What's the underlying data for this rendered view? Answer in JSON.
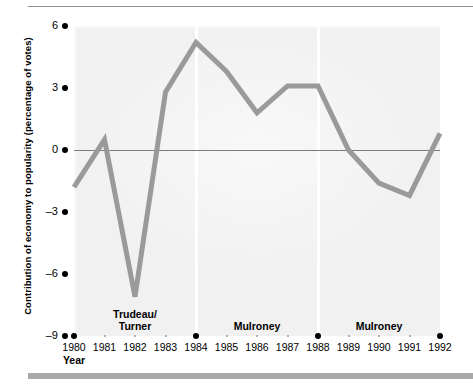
{
  "chart_data": {
    "type": "line",
    "title": "",
    "xlabel": "Year",
    "ylabel": "Contribution of economy to popularity (percentage of votes)",
    "x": [
      1980,
      1981,
      1982,
      1983,
      1984,
      1985,
      1986,
      1987,
      1988,
      1989,
      1990,
      1991,
      1992
    ],
    "values": [
      -1.8,
      0.5,
      -7.1,
      2.8,
      5.2,
      3.8,
      1.8,
      3.1,
      3.1,
      0.0,
      -1.6,
      -2.2,
      0.8
    ],
    "series": [
      {
        "name": "Contribution of economy to popularity",
        "values": [
          -1.8,
          0.5,
          -7.1,
          2.8,
          5.2,
          3.8,
          1.8,
          3.1,
          3.1,
          0.0,
          -1.6,
          -2.2,
          0.8
        ]
      }
    ],
    "xlim": [
      1980,
      1992
    ],
    "ylim": [
      -9,
      6
    ],
    "ytick_values": [
      6,
      3,
      0,
      -3,
      -6,
      -9
    ],
    "ytick_labels": [
      "6",
      "3",
      "0",
      "–3",
      "–6",
      "–9"
    ],
    "xtick_labels": [
      "1980",
      "1981",
      "1982",
      "1983",
      "1984",
      "1985",
      "1986",
      "1987",
      "1988",
      "1989",
      "1990",
      "1991",
      "1992"
    ],
    "election_years": [
      1980,
      1984,
      1988,
      1992
    ],
    "grid": false,
    "legend": "none",
    "zero_line": true,
    "annotations": [
      {
        "text": "Trudeau/\nTurner",
        "x": 1982,
        "name": "era-trudeau-turner"
      },
      {
        "text": "Mulroney",
        "x": 1986,
        "name": "era-mulroney-first"
      },
      {
        "text": "Mulroney",
        "x": 1990,
        "name": "era-mulroney-second"
      }
    ],
    "colors": {
      "series_line": "#9a9a9a",
      "plot_background": "#f1f1f1",
      "zero_line": "#7d7d7d",
      "axis_text": "#000000",
      "rule": "#8f8f8f",
      "footer_bar": "#a9a9a9",
      "separator": "#ffffff"
    }
  }
}
